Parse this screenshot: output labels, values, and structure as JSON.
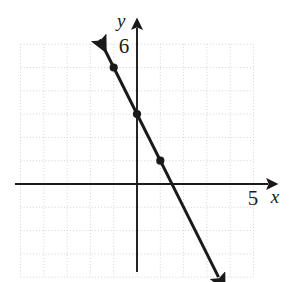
{
  "figure": {
    "kind": "coordinate-plane-line-graph",
    "width": 296,
    "height": 282,
    "background_color": "#ffffff",
    "ink_color": "#1a1a1a",
    "grid_color": "#cfcfd4"
  },
  "axes": {
    "x_axis_label": "x",
    "y_axis_label": "y",
    "x_tick_label": "5",
    "y_tick_label": "6",
    "origin_px": {
      "x": 137,
      "y": 184
    },
    "unit_px": 23.3,
    "x_range": [
      -5,
      6
    ],
    "y_range": [
      -4,
      6
    ],
    "x_axis_arrow": "right",
    "y_axis_arrow": "up",
    "grid": "dotted"
  },
  "chart_data": {
    "type": "line",
    "title": "",
    "xlabel": "x",
    "ylabel": "y",
    "xlim": [
      -5,
      6
    ],
    "ylim": [
      -4,
      6
    ],
    "grid": true,
    "legend": "none",
    "series": [
      {
        "name": "y = -2x + 3",
        "equation": "y = -2x + 3",
        "slope": -2,
        "y_intercept": 3,
        "x_intercept": 1.5,
        "arrows": "both",
        "endpoints": [
          {
            "x": -1.6,
            "y": 6.2
          },
          {
            "x": 3.5,
            "y": -4.0
          }
        ],
        "marked_points": [
          {
            "x": -1,
            "y": 5
          },
          {
            "x": 0,
            "y": 3
          },
          {
            "x": 1,
            "y": 1
          }
        ]
      }
    ]
  },
  "grid_lines": {
    "x_values": [
      -5,
      -4,
      -3,
      -2,
      -1,
      0,
      1,
      2,
      3,
      4,
      5
    ],
    "y_values": [
      -4,
      -3,
      -2,
      -1,
      0,
      1,
      2,
      3,
      4,
      5,
      6
    ]
  }
}
